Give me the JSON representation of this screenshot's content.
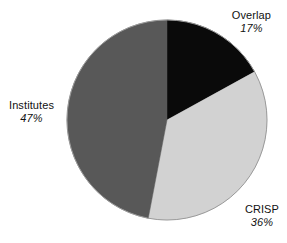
{
  "chart_data": {
    "type": "pie",
    "title": "",
    "subtitle": "",
    "xlabel": "",
    "ylabel": "",
    "legend_position": "none",
    "grid": false,
    "labels_outside": true,
    "start_angle_deg": 0,
    "direction": "clockwise",
    "categories": [
      "Overlap",
      "CRISP",
      "Institutes"
    ],
    "values": [
      17,
      36,
      47
    ],
    "unit": "%",
    "slices": [
      {
        "name": "Overlap",
        "value": 17,
        "value_text": "17%",
        "color": "#0a0a0a",
        "start_deg": 0,
        "end_deg": 61.2
      },
      {
        "name": "CRISP",
        "value": 36,
        "value_text": "36%",
        "color": "#d2d2d2",
        "start_deg": 61.2,
        "end_deg": 190.8
      },
      {
        "name": "Institutes",
        "value": 47,
        "value_text": "47%",
        "color": "#585858",
        "start_deg": 190.8,
        "end_deg": 360
      }
    ]
  },
  "labels": {
    "overlap": {
      "name": "Overlap",
      "value": "17%"
    },
    "crisp": {
      "name": "CRISP",
      "value": "36%"
    },
    "institutes": {
      "name": "Institutes",
      "value": "47%"
    }
  },
  "colors": {
    "overlap": "#0a0a0a",
    "crisp": "#d2d2d2",
    "institutes": "#585858",
    "outline": "#9a9a9a",
    "text": "#111111",
    "background": "#ffffff"
  },
  "geometry": {
    "center_x": 167,
    "center_y": 120,
    "radius": 100
  }
}
